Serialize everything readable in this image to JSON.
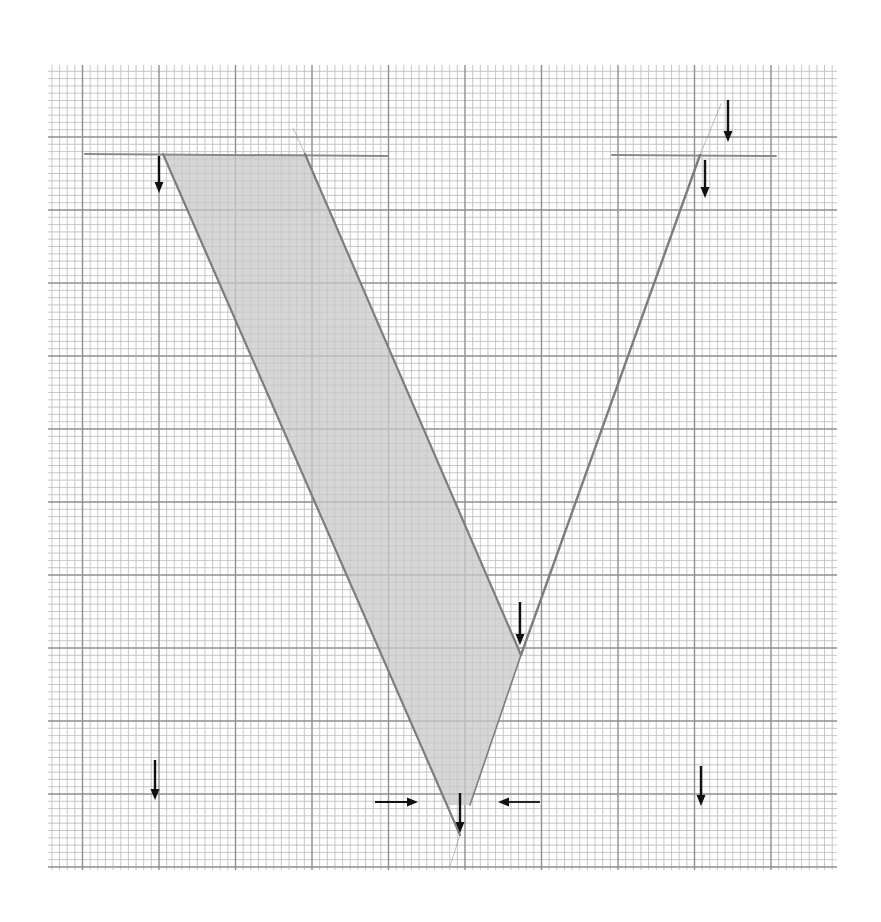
{
  "canvas": {
    "width": 881,
    "height": 922,
    "background": "#ffffff"
  },
  "grid": {
    "x0": 48,
    "y0": 65,
    "x1": 837,
    "y1": 870,
    "minor_step_x": 7.65,
    "minor_step_y": 7.3,
    "major_every": 10,
    "major_x_origin": 82.5,
    "major_y_origin": 137,
    "minor_color": "#b9b9b9",
    "major_color": "#8e8e8e",
    "minor_width": 0.8,
    "major_width": 1.4
  },
  "letter": {
    "name": "V",
    "stroke_color": "#7d7d7d",
    "shade_color": "#c8c8c8",
    "guide_lines": [
      {
        "id": "cap-line-left",
        "x1": 85,
        "y1": 154,
        "x2": 388,
        "y2": 156
      },
      {
        "id": "cap-line-right",
        "x1": 612,
        "y1": 155,
        "x2": 776,
        "y2": 156
      }
    ],
    "thick_stem": [
      [
        163,
        154
      ],
      [
        305,
        154
      ],
      [
        521,
        655
      ],
      [
        470,
        805
      ],
      [
        447,
        805
      ]
    ],
    "strokes": [
      {
        "id": "thick-stem-left-edge",
        "x1": 163,
        "y1": 154,
        "x2": 460,
        "y2": 835,
        "w": 2.2
      },
      {
        "id": "thick-stem-right-edge",
        "x1": 305,
        "y1": 154,
        "x2": 521,
        "y2": 655,
        "w": 2.2
      },
      {
        "id": "thin-stem-outer",
        "x1": 700,
        "y1": 155,
        "x2": 521,
        "y2": 655,
        "w": 2.4
      },
      {
        "id": "thin-stem-lower",
        "x1": 521,
        "y1": 655,
        "x2": 470,
        "y2": 805,
        "w": 1.6
      },
      {
        "id": "construction-top-left",
        "x1": 293,
        "y1": 128,
        "x2": 305,
        "y2": 154,
        "w": 0.8
      },
      {
        "id": "construction-top-right",
        "x1": 700,
        "y1": 155,
        "x2": 721,
        "y2": 104,
        "w": 0.8
      },
      {
        "id": "construction-bottom",
        "x1": 460,
        "y1": 835,
        "x2": 450,
        "y2": 866,
        "w": 0.8
      }
    ]
  },
  "arrows": [
    {
      "id": "arrow-top-left-down",
      "dir": "down",
      "x": 159,
      "y1": 156,
      "y2": 193
    },
    {
      "id": "arrow-top-right-outer-down",
      "dir": "down",
      "x": 728,
      "y1": 100,
      "y2": 142
    },
    {
      "id": "arrow-top-right-inner-down",
      "dir": "down",
      "x": 705,
      "y1": 160,
      "y2": 198
    },
    {
      "id": "arrow-vertex-inner-down",
      "dir": "down",
      "x": 520,
      "y1": 602,
      "y2": 645
    },
    {
      "id": "arrow-bottom-left-down",
      "dir": "down",
      "x": 155,
      "y1": 760,
      "y2": 800
    },
    {
      "id": "arrow-bottom-right-down",
      "dir": "down",
      "x": 701,
      "y1": 766,
      "y2": 806
    },
    {
      "id": "arrow-apex-down",
      "dir": "down",
      "x": 460,
      "y1": 793,
      "y2": 833
    },
    {
      "id": "arrow-apex-from-left",
      "dir": "right",
      "y": 802,
      "x1": 375,
      "x2": 418
    },
    {
      "id": "arrow-apex-from-right",
      "dir": "left",
      "y": 802,
      "x1": 540,
      "x2": 498
    }
  ],
  "arrow_style": {
    "color": "#111111",
    "width": 2.4,
    "head_len": 11,
    "head_half": 4.5
  }
}
